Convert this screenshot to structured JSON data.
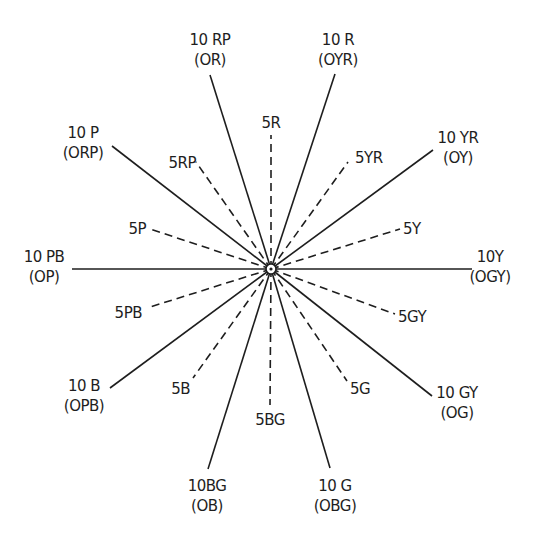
{
  "diagram": {
    "center": {
      "x": 271,
      "y": 269
    },
    "line_color": "#1e1e1e",
    "spokes": [
      {
        "id": "10RP",
        "style": "solid",
        "end": [
          210,
          75
        ],
        "label": "10 RP",
        "sublabel": "(OR)",
        "lx": 210,
        "ly": 45,
        "anchor": "middle"
      },
      {
        "id": "5R",
        "style": "dashed",
        "end": [
          271,
          135
        ],
        "label": "5R",
        "sublabel": "",
        "lx": 271,
        "ly": 128,
        "anchor": "middle"
      },
      {
        "id": "10R",
        "style": "solid",
        "end": [
          335,
          74
        ],
        "label": "10 R",
        "sublabel": "(OYR)",
        "lx": 338,
        "ly": 45,
        "anchor": "middle"
      },
      {
        "id": "5YR",
        "style": "dashed",
        "end": [
          348,
          162
        ],
        "label": "5YR",
        "sublabel": "",
        "lx": 355,
        "ly": 163,
        "anchor": "start"
      },
      {
        "id": "10YR",
        "style": "solid",
        "end": [
          433,
          150
        ],
        "label": "10 YR",
        "sublabel": "(OY)",
        "lx": 458,
        "ly": 143,
        "anchor": "middle"
      },
      {
        "id": "5Y",
        "style": "dashed",
        "end": [
          400,
          229
        ],
        "label": "5Y",
        "sublabel": "",
        "lx": 403,
        "ly": 234,
        "anchor": "start"
      },
      {
        "id": "10Y",
        "style": "solid",
        "end": [
          472,
          269
        ],
        "label": "10Y",
        "sublabel": "(OGY)",
        "lx": 490,
        "ly": 262,
        "anchor": "middle"
      },
      {
        "id": "5GY",
        "style": "dashed",
        "end": [
          395,
          314
        ],
        "label": "5GY",
        "sublabel": "",
        "lx": 398,
        "ly": 322,
        "anchor": "start"
      },
      {
        "id": "10GY",
        "style": "solid",
        "end": [
          432,
          396
        ],
        "label": "10 GY",
        "sublabel": "(OG)",
        "lx": 457,
        "ly": 398,
        "anchor": "middle"
      },
      {
        "id": "5G",
        "style": "dashed",
        "end": [
          347,
          381
        ],
        "label": "5G",
        "sublabel": "",
        "lx": 350,
        "ly": 394,
        "anchor": "start"
      },
      {
        "id": "10G",
        "style": "solid",
        "end": [
          330,
          468
        ],
        "label": "10 G",
        "sublabel": "(OBG)",
        "lx": 335,
        "ly": 491,
        "anchor": "middle"
      },
      {
        "id": "5BG",
        "style": "dashed",
        "end": [
          270,
          405
        ],
        "label": "5BG",
        "sublabel": "",
        "lx": 270,
        "ly": 425,
        "anchor": "middle"
      },
      {
        "id": "10BG",
        "style": "solid",
        "end": [
          208,
          469
        ],
        "label": "10BG",
        "sublabel": "(OB)",
        "lx": 207,
        "ly": 491,
        "anchor": "middle"
      },
      {
        "id": "5B",
        "style": "dashed",
        "end": [
          193,
          378
        ],
        "label": "5B",
        "sublabel": "",
        "lx": 190,
        "ly": 394,
        "anchor": "end"
      },
      {
        "id": "10B",
        "style": "solid",
        "end": [
          110,
          388
        ],
        "label": "10 B",
        "sublabel": "(OPB)",
        "lx": 84,
        "ly": 391,
        "anchor": "middle"
      },
      {
        "id": "5PB",
        "style": "dashed",
        "end": [
          147,
          308
        ],
        "label": "5PB",
        "sublabel": "",
        "lx": 142,
        "ly": 318,
        "anchor": "end"
      },
      {
        "id": "10PB",
        "style": "solid",
        "end": [
          72,
          269
        ],
        "label": "10 PB",
        "sublabel": "(OP)",
        "lx": 44,
        "ly": 262,
        "anchor": "middle"
      },
      {
        "id": "5P",
        "style": "dashed",
        "end": [
          150,
          229
        ],
        "label": "5P",
        "sublabel": "",
        "lx": 146,
        "ly": 234,
        "anchor": "end"
      },
      {
        "id": "10P",
        "style": "solid",
        "end": [
          112,
          146
        ],
        "label": "10 P",
        "sublabel": "(ORP)",
        "lx": 83,
        "ly": 138,
        "anchor": "middle"
      },
      {
        "id": "5RP",
        "style": "dashed",
        "end": [
          196,
          162
        ],
        "label": "5RP",
        "sublabel": "",
        "lx": 196,
        "ly": 168,
        "anchor": "end"
      }
    ]
  }
}
